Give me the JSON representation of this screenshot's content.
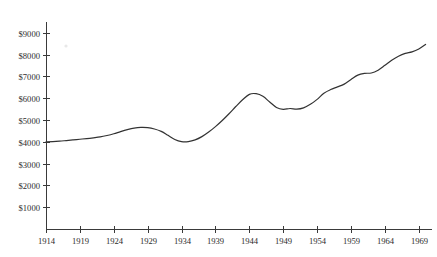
{
  "chart_data": {
    "type": "line",
    "title": "",
    "subtitle": "",
    "xlabel": "",
    "ylabel": "",
    "xlim": [
      1914,
      1970
    ],
    "ylim": [
      0,
      9500
    ],
    "grid": false,
    "legend": null,
    "legend_position": "none",
    "line_color": "#333333",
    "line_width": 1.2,
    "background_color": "#ffffff",
    "axis_color": "#3a3a3a",
    "y_tick_labels": [
      "$9000",
      "$8000",
      "$7000",
      "$6000",
      "$5000",
      "$4000",
      "$3000",
      "$2000",
      "$1000"
    ],
    "y_tick_values": [
      9000,
      8000,
      7000,
      6000,
      5000,
      4000,
      3000,
      2000,
      1000
    ],
    "x_tick_labels": [
      "1914",
      "1919",
      "1924",
      "1929",
      "1934",
      "1939",
      "1944",
      "1949",
      "1954",
      "1959",
      "1964",
      "1969"
    ],
    "x_tick_values": [
      1914,
      1919,
      1924,
      1929,
      1934,
      1939,
      1944,
      1949,
      1954,
      1959,
      1964,
      1969
    ],
    "x": [
      1914,
      1915,
      1916,
      1917,
      1918,
      1919,
      1920,
      1921,
      1922,
      1923,
      1924,
      1925,
      1926,
      1927,
      1928,
      1929,
      1930,
      1931,
      1932,
      1933,
      1934,
      1935,
      1936,
      1937,
      1938,
      1939,
      1940,
      1941,
      1942,
      1943,
      1944,
      1945,
      1946,
      1947,
      1948,
      1949,
      1950,
      1951,
      1952,
      1953,
      1954,
      1955,
      1956,
      1957,
      1958,
      1959,
      1960,
      1961,
      1962,
      1963,
      1964,
      1965,
      1966,
      1967,
      1968,
      1969,
      1970
    ],
    "values": [
      4000,
      4010,
      4030,
      4060,
      4090,
      4120,
      4150,
      4185,
      4225,
      4290,
      4370,
      4470,
      4560,
      4630,
      4660,
      4650,
      4590,
      4480,
      4300,
      4110,
      4010,
      4010,
      4090,
      4240,
      4450,
      4700,
      4980,
      5290,
      5620,
      5930,
      6180,
      6210,
      6090,
      5830,
      5580,
      5490,
      5530,
      5500,
      5560,
      5720,
      5950,
      6230,
      6400,
      6520,
      6650,
      6860,
      7060,
      7140,
      7160,
      7290,
      7510,
      7740,
      7930,
      8060,
      8130,
      8260,
      8470
    ],
    "series": [
      {
        "name": "value",
        "values": [
          4000,
          4010,
          4030,
          4060,
          4090,
          4120,
          4150,
          4185,
          4225,
          4290,
          4370,
          4470,
          4560,
          4630,
          4660,
          4650,
          4590,
          4480,
          4300,
          4110,
          4010,
          4010,
          4090,
          4240,
          4450,
          4700,
          4980,
          5290,
          5620,
          5930,
          6180,
          6210,
          6090,
          5830,
          5580,
          5490,
          5530,
          5500,
          5560,
          5720,
          5950,
          6230,
          6400,
          6520,
          6650,
          6860,
          7060,
          7140,
          7160,
          7290,
          7510,
          7740,
          7930,
          8060,
          8130,
          8260,
          8470
        ]
      }
    ],
    "annotations": []
  },
  "axis_geometry": {
    "plot_left": 46,
    "plot_right": 431,
    "plot_top": 22,
    "plot_bottom": 229,
    "y_value_at_bottom": 0,
    "y_value_at_top": 9500,
    "x_value_at_left": 1914,
    "x_value_at_right": 1970.8
  }
}
